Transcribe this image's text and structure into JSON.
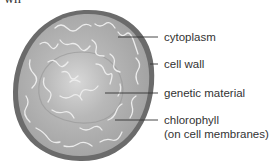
{
  "header_fragment": "wn",
  "diagram": {
    "subject": "cell",
    "colors": {
      "wall": "#6b6b6b",
      "cytoplasm": "#a9a9a9",
      "center": "#d6d6d6",
      "strands": "#e8e8e8",
      "leader": "#333333",
      "text": "#333333"
    },
    "labels": [
      {
        "id": "cytoplasm",
        "text": "cytoplasm"
      },
      {
        "id": "cell-wall",
        "text": "cell wall"
      },
      {
        "id": "genetic-material",
        "text": "genetic material"
      },
      {
        "id": "chlorophyll",
        "text": "chlorophyll",
        "subtext": "(on cell membranes)"
      }
    ]
  }
}
